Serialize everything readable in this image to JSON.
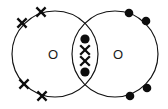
{
  "figure": {
    "kind": "dot-and-cross-diagram",
    "molecule_label": "O2",
    "background_color": "#ffffff",
    "ink_color": "#0d0d0d",
    "stroke_color": "#111111",
    "width": 168,
    "height": 109
  },
  "atoms": [
    {
      "id": "left-atom",
      "label": "O",
      "electron_symbol": "cross",
      "center": {
        "x": 55,
        "y": 54
      },
      "radius": 43,
      "label_position": {
        "x": 53,
        "y": 54
      },
      "lone_electron_count": 4
    },
    {
      "id": "right-atom",
      "label": "O",
      "electron_symbol": "dot",
      "center": {
        "x": 115,
        "y": 54
      },
      "radius": 43,
      "label_position": {
        "x": 118,
        "y": 54
      },
      "lone_electron_count": 4
    }
  ],
  "outer_electrons": [
    {
      "owner": "left-atom",
      "symbol": "cross",
      "x": 22,
      "y": 23,
      "name": "cross-upper-left-outer"
    },
    {
      "owner": "left-atom",
      "symbol": "cross",
      "x": 41,
      "y": 12,
      "name": "cross-top-left"
    },
    {
      "owner": "left-atom",
      "symbol": "cross",
      "x": 24,
      "y": 84,
      "name": "cross-lower-left-outer"
    },
    {
      "owner": "left-atom",
      "symbol": "cross",
      "x": 42,
      "y": 96,
      "name": "cross-bottom-left"
    },
    {
      "owner": "right-atom",
      "symbol": "dot",
      "x": 129,
      "y": 13,
      "name": "dot-top-right"
    },
    {
      "owner": "right-atom",
      "symbol": "dot",
      "x": 146,
      "y": 21,
      "name": "dot-upper-right-outer"
    },
    {
      "owner": "right-atom",
      "symbol": "dot",
      "x": 147,
      "y": 88,
      "name": "dot-lower-right-outer"
    },
    {
      "owner": "right-atom",
      "symbol": "dot",
      "x": 130,
      "y": 96,
      "name": "dot-bottom-right"
    }
  ],
  "shared_electrons": {
    "region": "overlap-lens",
    "center": {
      "x": 85,
      "y": 55
    },
    "bond_order": 2,
    "pairs": 2,
    "electrons": [
      {
        "symbol": "dot",
        "x": 85,
        "y": 39,
        "name": "shared-dot-top"
      },
      {
        "symbol": "cross",
        "x": 85,
        "y": 50,
        "name": "shared-cross-upper"
      },
      {
        "symbol": "cross",
        "x": 85,
        "y": 61,
        "name": "shared-cross-lower"
      },
      {
        "symbol": "dot",
        "x": 85,
        "y": 72,
        "name": "shared-dot-bottom"
      }
    ]
  },
  "geometry": {
    "dot_radius": 4.3,
    "cross_arm": 4.6,
    "shared_dot_radius": 4.6,
    "shared_cross_arm": 4.8
  }
}
